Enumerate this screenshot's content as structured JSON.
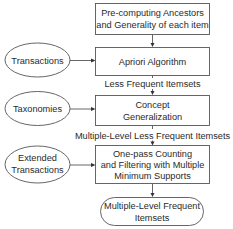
{
  "diagram": {
    "type": "flowchart",
    "process_boxes": [
      {
        "id": "precompute",
        "lines": [
          "Pre-computing Ancestors",
          "and Generality of each item"
        ]
      },
      {
        "id": "apriori",
        "lines": [
          "Apriori Algorithm"
        ]
      },
      {
        "id": "concept",
        "lines": [
          "Concept",
          "Generalization"
        ]
      },
      {
        "id": "onepass",
        "lines": [
          "One-pass Counting",
          "and Filtering with Multiple",
          "Minimum Supports"
        ]
      }
    ],
    "inputs": [
      {
        "id": "transactions",
        "lines": [
          "Transactions"
        ]
      },
      {
        "id": "taxonomies",
        "lines": [
          "Taxonomies"
        ]
      },
      {
        "id": "extended",
        "lines": [
          "Extended",
          "Transactions"
        ]
      }
    ],
    "output": {
      "id": "result",
      "lines": [
        "Multiple-Level Frequent",
        "Itemsets"
      ]
    },
    "edge_labels": {
      "apriori_to_concept": "Less Frequent Itemsets",
      "concept_to_onepass": "Multiple-Level Less Frequent Itemsets"
    },
    "edges": [
      {
        "from": "precompute",
        "to": "apriori"
      },
      {
        "from": "transactions",
        "to": "apriori"
      },
      {
        "from": "apriori",
        "to": "concept",
        "label": "Less Frequent Itemsets"
      },
      {
        "from": "taxonomies",
        "to": "concept"
      },
      {
        "from": "concept",
        "to": "onepass",
        "label": "Multiple-Level Less Frequent Itemsets"
      },
      {
        "from": "extended",
        "to": "onepass"
      },
      {
        "from": "onepass",
        "to": "result"
      }
    ]
  }
}
